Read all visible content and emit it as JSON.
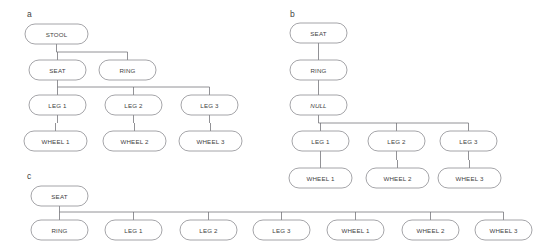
{
  "figure": {
    "type": "tree-diagram",
    "background_color": "#ffffff",
    "node_fill": "#ffffff",
    "node_stroke": "#8e8e93",
    "edge_stroke": "#6e6e73",
    "text_color": "#3f3f3f"
  },
  "panels": [
    {
      "id": "a",
      "label": "a",
      "label_pos": {
        "x": 27,
        "y": 17
      },
      "nodes": [
        {
          "id": "a-stool",
          "text": "STOOL",
          "x": 25,
          "y": 24,
          "w": 63,
          "h": 20,
          "italic": false
        },
        {
          "id": "a-seat",
          "text": "SEAT",
          "x": 29,
          "y": 60,
          "w": 57,
          "h": 20,
          "italic": false
        },
        {
          "id": "a-ring",
          "text": "RING",
          "x": 99,
          "y": 60,
          "w": 57,
          "h": 20,
          "italic": false
        },
        {
          "id": "a-leg1",
          "text": "LEG 1",
          "x": 29,
          "y": 95,
          "w": 57,
          "h": 20,
          "italic": false
        },
        {
          "id": "a-leg2",
          "text": "LEG 2",
          "x": 105,
          "y": 95,
          "w": 57,
          "h": 20,
          "italic": false
        },
        {
          "id": "a-leg3",
          "text": "LEG 3",
          "x": 181,
          "y": 95,
          "w": 57,
          "h": 20,
          "italic": false
        },
        {
          "id": "a-wheel1",
          "text": "WHEEL 1",
          "x": 24,
          "y": 131,
          "w": 63,
          "h": 20,
          "italic": false
        },
        {
          "id": "a-wheel2",
          "text": "WHEEL 2",
          "x": 103,
          "y": 131,
          "w": 63,
          "h": 20,
          "italic": false
        },
        {
          "id": "a-wheel3",
          "text": "WHEEL 3",
          "x": 179,
          "y": 131,
          "w": 63,
          "h": 20,
          "italic": false
        }
      ],
      "edges": [
        {
          "from": "a-stool",
          "to": [
            "a-seat",
            "a-ring"
          ],
          "bus_y": 52
        },
        {
          "from": "a-seat",
          "to": [
            "a-leg1",
            "a-leg2",
            "a-leg3"
          ],
          "bus_y": 87
        },
        {
          "from": "a-leg1",
          "to": [
            "a-wheel1"
          ],
          "bus_y": 123
        },
        {
          "from": "a-leg2",
          "to": [
            "a-wheel2"
          ],
          "bus_y": 123
        },
        {
          "from": "a-leg3",
          "to": [
            "a-wheel3"
          ],
          "bus_y": 123
        }
      ]
    },
    {
      "id": "b",
      "label": "b",
      "label_pos": {
        "x": 290,
        "y": 17
      },
      "nodes": [
        {
          "id": "b-seat",
          "text": "SEAT",
          "x": 290,
          "y": 23,
          "w": 57,
          "h": 20,
          "italic": false
        },
        {
          "id": "b-ring",
          "text": "RING",
          "x": 290,
          "y": 60,
          "w": 57,
          "h": 20,
          "italic": false
        },
        {
          "id": "b-null",
          "text": "NULL",
          "x": 290,
          "y": 95,
          "w": 57,
          "h": 20,
          "italic": true
        },
        {
          "id": "b-leg1",
          "text": "LEG 1",
          "x": 292,
          "y": 131,
          "w": 57,
          "h": 20,
          "italic": false
        },
        {
          "id": "b-leg2",
          "text": "LEG 2",
          "x": 368,
          "y": 131,
          "w": 57,
          "h": 20,
          "italic": false
        },
        {
          "id": "b-leg3",
          "text": "LEG 3",
          "x": 440,
          "y": 131,
          "w": 57,
          "h": 20,
          "italic": false
        },
        {
          "id": "b-wheel1",
          "text": "WHEEL 1",
          "x": 289,
          "y": 168,
          "w": 63,
          "h": 20,
          "italic": false
        },
        {
          "id": "b-wheel2",
          "text": "WHEEL 2",
          "x": 366,
          "y": 168,
          "w": 63,
          "h": 20,
          "italic": false
        },
        {
          "id": "b-wheel3",
          "text": "WHEEL 3",
          "x": 438,
          "y": 168,
          "w": 63,
          "h": 20,
          "italic": false
        }
      ],
      "edges": [
        {
          "from": "b-seat",
          "to": [
            "b-ring"
          ],
          "bus_y": 52
        },
        {
          "from": "b-ring",
          "to": [
            "b-null"
          ],
          "bus_y": 88
        },
        {
          "from": "b-null",
          "to": [
            "b-leg1",
            "b-leg2",
            "b-leg3"
          ],
          "bus_y": 123
        },
        {
          "from": "b-leg1",
          "to": [
            "b-wheel1"
          ],
          "bus_y": 160
        },
        {
          "from": "b-leg2",
          "to": [
            "b-wheel2"
          ],
          "bus_y": 160
        },
        {
          "from": "b-leg3",
          "to": [
            "b-wheel3"
          ],
          "bus_y": 160
        }
      ]
    },
    {
      "id": "c",
      "label": "c",
      "label_pos": {
        "x": 27,
        "y": 179
      },
      "nodes": [
        {
          "id": "c-seat",
          "text": "SEAT",
          "x": 31,
          "y": 186,
          "w": 57,
          "h": 20,
          "italic": false
        },
        {
          "id": "c-ring",
          "text": "RING",
          "x": 31,
          "y": 220,
          "w": 57,
          "h": 20,
          "italic": false
        },
        {
          "id": "c-leg1",
          "text": "LEG 1",
          "x": 105,
          "y": 220,
          "w": 57,
          "h": 20,
          "italic": false
        },
        {
          "id": "c-leg2",
          "text": "LEG 2",
          "x": 180,
          "y": 220,
          "w": 57,
          "h": 20,
          "italic": false
        },
        {
          "id": "c-leg3",
          "text": "LEG 3",
          "x": 253,
          "y": 220,
          "w": 57,
          "h": 20,
          "italic": false
        },
        {
          "id": "c-wheel1",
          "text": "WHEEL 1",
          "x": 327,
          "y": 220,
          "w": 57,
          "h": 20,
          "italic": false
        },
        {
          "id": "c-wheel2",
          "text": "WHEEL 2",
          "x": 402,
          "y": 220,
          "w": 57,
          "h": 20,
          "italic": false
        },
        {
          "id": "c-wheel3",
          "text": "WHEEL 3",
          "x": 475,
          "y": 220,
          "w": 57,
          "h": 20,
          "italic": false
        }
      ],
      "edges": [
        {
          "from": "c-seat",
          "to": [
            "c-ring",
            "c-leg1",
            "c-leg2",
            "c-leg3",
            "c-wheel1",
            "c-wheel2",
            "c-wheel3"
          ],
          "bus_y": 212
        }
      ]
    }
  ]
}
